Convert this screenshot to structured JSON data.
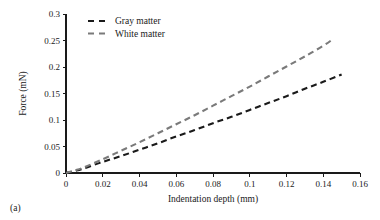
{
  "figure": {
    "subfigure_label": "(a)"
  },
  "chart_data": {
    "type": "line",
    "title": "",
    "xlabel": "Indentation depth (mm)",
    "ylabel": "Force (mN)",
    "xlim": [
      0,
      0.16
    ],
    "ylim": [
      0,
      0.3
    ],
    "xticks": [
      0,
      0.02,
      0.04,
      0.06,
      0.08,
      0.1,
      0.12,
      0.14,
      0.16
    ],
    "yticks": [
      0,
      0.05,
      0.1,
      0.15,
      0.2,
      0.25,
      0.3
    ],
    "xticklabels": [
      "0",
      "0.02",
      "0.04",
      "0.06",
      "0.08",
      "0.1",
      "0.12",
      "0.14",
      "0.16"
    ],
    "yticklabels": [
      "0",
      "0.05",
      "0.1",
      "0.15",
      "0.2",
      "0.25",
      "0.3"
    ],
    "grid": false,
    "legend_position": "upper-left-inside",
    "series": [
      {
        "name": "Gray matter",
        "color": "#1a1a1a",
        "linestyle": "dashed",
        "linewidth": 2.1,
        "dasharray": "6,4",
        "x": [
          0,
          0.005,
          0.01,
          0.02,
          0.03,
          0.04,
          0.05,
          0.06,
          0.07,
          0.08,
          0.09,
          0.1,
          0.11,
          0.12,
          0.13,
          0.14,
          0.15
        ],
        "y": [
          0,
          0.004,
          0.009,
          0.021,
          0.032,
          0.044,
          0.056,
          0.069,
          0.081,
          0.094,
          0.106,
          0.119,
          0.132,
          0.145,
          0.159,
          0.172,
          0.186
        ]
      },
      {
        "name": "White matter",
        "color": "#7a7a7a",
        "linestyle": "dashed",
        "linewidth": 2.1,
        "dasharray": "6,4",
        "x": [
          0,
          0.005,
          0.01,
          0.02,
          0.03,
          0.04,
          0.05,
          0.06,
          0.07,
          0.08,
          0.09,
          0.1,
          0.11,
          0.12,
          0.13,
          0.14,
          0.145
        ],
        "y": [
          0,
          0.005,
          0.011,
          0.026,
          0.042,
          0.058,
          0.075,
          0.092,
          0.109,
          0.127,
          0.145,
          0.163,
          0.182,
          0.201,
          0.22,
          0.24,
          0.252
        ]
      }
    ]
  }
}
